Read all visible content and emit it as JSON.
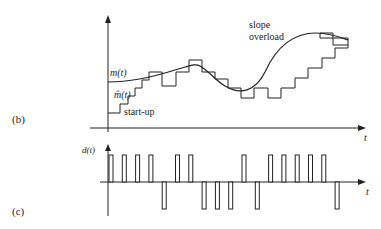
{
  "figure": {
    "panel_b": {
      "label": "(b)",
      "signal_label": "m(t)",
      "approx_label": "m̂(t)",
      "startup_label": "start-up",
      "overload_label_line1": "slope",
      "overload_label_line2": "overload",
      "time_axis_label": "t"
    },
    "panel_c": {
      "label": "(c)",
      "signal_label": "d(t)",
      "time_axis_label": "t",
      "pulse_signs": [
        1,
        1,
        1,
        1,
        -1,
        1,
        1,
        -1,
        -1,
        -1,
        1,
        -1,
        1,
        1,
        1,
        1,
        1,
        -1
      ]
    },
    "colors": {
      "stroke": "#222222",
      "background": "#ffffff"
    }
  }
}
